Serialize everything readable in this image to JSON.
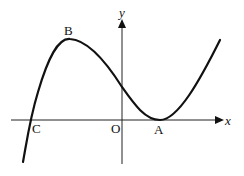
{
  "diagram": {
    "type": "cubic-curve-sketch",
    "axes": {
      "x_label": "x",
      "y_label": "y",
      "origin_label": "O"
    },
    "points": [
      {
        "label": "A",
        "description": "minimum touching x-axis (repeated root)"
      },
      {
        "label": "B",
        "description": "local maximum"
      },
      {
        "label": "C",
        "description": "x-intercept"
      }
    ],
    "colors": {
      "curve": "#111111",
      "axes": "#222222",
      "background": "#ffffff"
    }
  }
}
